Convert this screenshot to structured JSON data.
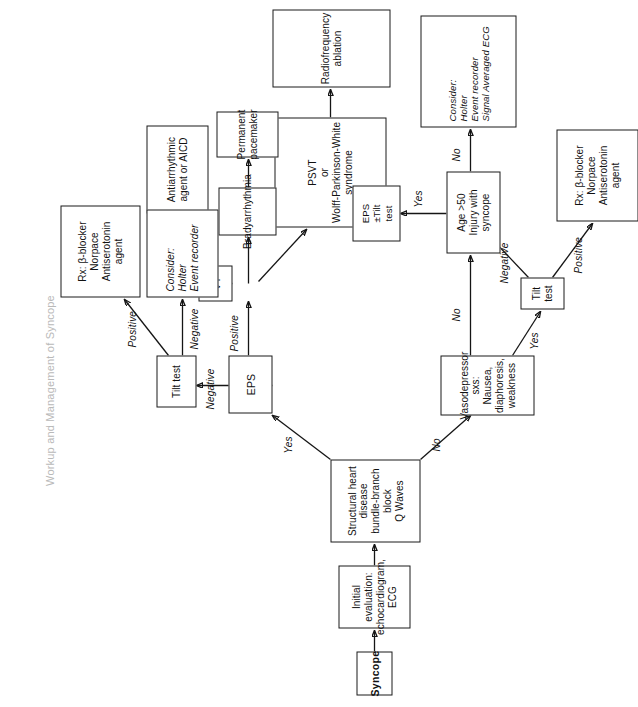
{
  "page": {
    "header_watermark": "Workup and Management of Syncope",
    "orientation": "rotated-90-ccw",
    "ink_color": "#151515",
    "watermark_color": "#b9b9b9"
  },
  "diagram": {
    "type": "clinical-algorithm-flowchart",
    "title": "Workup and Management of Syncope",
    "nodes": [
      {
        "id": "syncope",
        "label": "Syncope"
      },
      {
        "id": "initial_eval",
        "label": "Initial evaluation:\nechocardiogram,\nECG"
      },
      {
        "id": "structural",
        "label": "Structural heart\ndisease\nbundle-branch block\nQ Waves"
      },
      {
        "id": "eps",
        "label": "EPS"
      },
      {
        "id": "vt",
        "label": "VT"
      },
      {
        "id": "antiarrhythmic",
        "label": "Antiarrhythmic\nagent or AICD"
      },
      {
        "id": "psvt",
        "label": "PSVT\nor\nWolff-Parkinson-White\nsyndrome"
      },
      {
        "id": "rf_ablation",
        "label": "Radiofrequency ablation"
      },
      {
        "id": "brady",
        "label": "Bradyarrhythmia"
      },
      {
        "id": "pacemaker",
        "label": "Permanent\npacemaker"
      },
      {
        "id": "tilt_upper",
        "label": "Tilt test"
      },
      {
        "id": "rx_upper",
        "label": "Rx: β-blocker\nNorpace\nAntiserotonin\nagent"
      },
      {
        "id": "consider_upper",
        "label": "Consider:\nHolter\nEvent recorder"
      },
      {
        "id": "vasodepressor",
        "label": "Vasodepressor sxs:\nNausea, diaphoresis, weakness"
      },
      {
        "id": "tilt_lower",
        "label": "Tilt test"
      },
      {
        "id": "rx_lower",
        "label": "Rx: β-blocker\nNorpace\nAntiserotonin\nagent"
      },
      {
        "id": "age50",
        "label": "Age >50\nInjury with\nsyncope"
      },
      {
        "id": "eps_tilt",
        "label": "EPS\n±Tilt\ntest"
      },
      {
        "id": "consider_lower",
        "label": "Consider:\nHolter\nEvent recorder\nSignal Averaged ECG"
      }
    ],
    "edges": [
      {
        "from": "syncope",
        "to": "initial_eval",
        "label": ""
      },
      {
        "from": "initial_eval",
        "to": "structural",
        "label": ""
      },
      {
        "from": "structural",
        "to": "eps",
        "label": "Yes"
      },
      {
        "from": "structural",
        "to": "vasodepressor",
        "label": "No"
      },
      {
        "from": "eps",
        "to": "vt",
        "label": "Positive"
      },
      {
        "from": "eps",
        "to": "brady",
        "label": ""
      },
      {
        "from": "eps",
        "to": "psvt",
        "label": ""
      },
      {
        "from": "vt",
        "to": "antiarrhythmic",
        "label": ""
      },
      {
        "from": "psvt",
        "to": "rf_ablation",
        "label": ""
      },
      {
        "from": "brady",
        "to": "pacemaker",
        "label": ""
      },
      {
        "from": "eps",
        "to": "tilt_upper",
        "label": "Negative"
      },
      {
        "from": "tilt_upper",
        "to": "rx_upper",
        "label": "Positive"
      },
      {
        "from": "tilt_upper",
        "to": "consider_upper",
        "label": "Negative"
      },
      {
        "from": "vasodepressor",
        "to": "tilt_lower",
        "label": "Yes"
      },
      {
        "from": "vasodepressor",
        "to": "age50",
        "label": "No"
      },
      {
        "from": "tilt_lower",
        "to": "rx_lower",
        "label": "Positive"
      },
      {
        "from": "tilt_lower",
        "to": "age50",
        "label": "Negative"
      },
      {
        "from": "age50",
        "to": "eps_tilt",
        "label": "Yes"
      },
      {
        "from": "age50",
        "to": "consider_lower",
        "label": "No"
      }
    ],
    "edge_labels": {
      "yes_to_eps": "Yes",
      "no_to_vaso": "No",
      "eps_positive": "Positive",
      "eps_negative": "Negative",
      "tilt_upper_positive": "Positive",
      "tilt_upper_negative": "Negative",
      "vaso_yes": "Yes",
      "vaso_no": "No",
      "tilt_lower_positive": "Positive",
      "tilt_lower_negative": "Negative",
      "age_yes": "Yes",
      "age_no": "No"
    }
  }
}
